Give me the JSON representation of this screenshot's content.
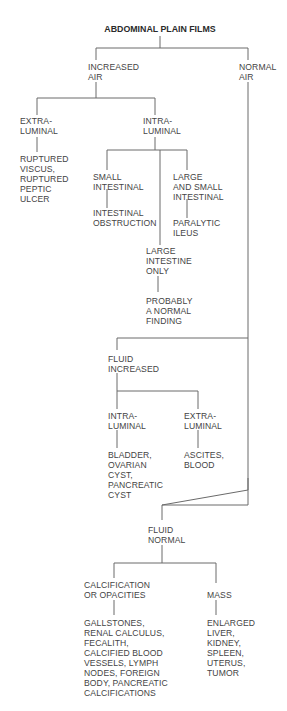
{
  "diagram": {
    "title": "ABDOMINAL PLAIN FILMS",
    "nodes": {
      "increased_air": [
        "INCREASED",
        "AIR"
      ],
      "normal_air": [
        "NORMAL",
        "AIR"
      ],
      "air_extraluminal": [
        "EXTRA-",
        "LUMINAL"
      ],
      "air_intraluminal": [
        "INTRA-",
        "LUMINAL"
      ],
      "ruptured": [
        "RUPTURED",
        "VISCUS,",
        "RUPTURED",
        "PEPTIC",
        "ULCER"
      ],
      "small_intestinal": [
        "SMALL",
        "INTESTINAL"
      ],
      "intestinal_obstruction": [
        "INTESTINAL",
        "OBSTRUCTION"
      ],
      "large_and_small": [
        "LARGE",
        "AND SMALL",
        "INTESTINAL"
      ],
      "paralytic_ileus": [
        "PARALYTIC",
        "ILEUS"
      ],
      "large_only": [
        "LARGE",
        "INTESTINE",
        "ONLY"
      ],
      "normal_finding": [
        "PROBABLY",
        "A NORMAL",
        "FINDING"
      ],
      "fluid_increased": [
        "FLUID",
        "INCREASED"
      ],
      "fluid_intraluminal": [
        "INTRA-",
        "LUMINAL"
      ],
      "fluid_extraluminal": [
        "EXTRA-",
        "LUMINAL"
      ],
      "bladder": [
        "BLADDER,",
        "OVARIAN",
        "CYST,",
        "PANCREATIC",
        "CYST"
      ],
      "ascites": [
        "ASCITES,",
        "BLOOD"
      ],
      "fluid_normal": [
        "FLUID",
        "NORMAL"
      ],
      "calcification": [
        "CALCIFICATION",
        "OR OPACITIES"
      ],
      "mass": [
        "MASS"
      ],
      "gallstones": [
        "GALLSTONES,",
        "RENAL CALCULUS,",
        "FECALITH,",
        "CALCIFIED BLOOD",
        "VESSELS, LYMPH",
        "NODES, FOREIGN",
        "BODY, PANCREATIC",
        "CALCIFICATIONS"
      ],
      "enlarged": [
        "ENLARGED",
        "LIVER,",
        "KIDNEY,",
        "SPLEEN,",
        "UTERUS,",
        "TUMOR"
      ]
    },
    "colors": {
      "line": "#6a6a6a",
      "text": "#444444",
      "background": "#ffffff"
    }
  }
}
